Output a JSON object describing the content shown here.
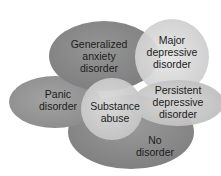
{
  "diagram": {
    "type": "overlapping-ellipses",
    "regions": [
      {
        "id": "generalized-anxiety",
        "lines": [
          "Generalized",
          "anxiety",
          "disorder"
        ],
        "color": "#8c8c8c"
      },
      {
        "id": "major-depressive",
        "lines": [
          "Major",
          "depressive",
          "disorder"
        ],
        "color": "#d9d9d9"
      },
      {
        "id": "panic",
        "lines": [
          "Panic",
          "disorder"
        ],
        "color": "#9a9a9a"
      },
      {
        "id": "persistent-depressive",
        "lines": [
          "Persistent",
          "depressive",
          "disorder"
        ],
        "color": "#cdcdcd"
      },
      {
        "id": "no-disorder",
        "lines": [
          "No",
          "disorder"
        ],
        "color": "#8f8f8f"
      },
      {
        "id": "substance-abuse",
        "lines": [
          "Substance",
          "abuse"
        ],
        "color": "#d2d2d2"
      }
    ]
  }
}
